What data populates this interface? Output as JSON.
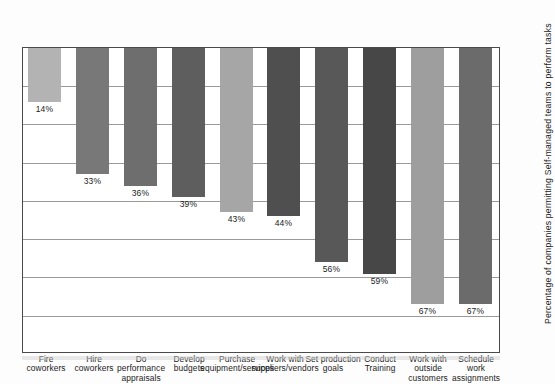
{
  "chart_data": {
    "type": "bar",
    "title": "",
    "xlabel": "",
    "ylabel": "Percentage of companies permitting Self-managed teams to perform tasks",
    "ylim": [
      0,
      80
    ],
    "grid": true,
    "legend": "none",
    "orientation": "vertical",
    "page_rotation_degrees": 180,
    "categories": [
      "Schedule work assignments",
      "Work with outside customers",
      "Conduct Training",
      "Set production goals",
      "Work with suppliers/vendors",
      "Purchase equipment/services",
      "Develop budgets",
      "Do performance appraisals",
      "Hire coworkers",
      "Fire coworkers"
    ],
    "values": [
      67,
      67,
      59,
      56,
      44,
      43,
      39,
      36,
      33,
      14
    ],
    "value_labels": [
      "67%",
      "67%",
      "59%",
      "56%",
      "44%",
      "43%",
      "39%",
      "36%",
      "33%",
      "14%"
    ],
    "bar_colors": [
      "#6b6b6b",
      "#9e9e9e",
      "#474747",
      "#585858",
      "#4f4f4f",
      "#a6a6a6",
      "#5e5e5e",
      "#6e6e6e",
      "#787878",
      "#b3b3b3"
    ],
    "gridline_values": [
      10,
      20,
      30,
      40,
      50,
      60,
      70
    ]
  },
  "axis": {
    "title": "Percentage of companies permitting Self-managed teams to perform tasks"
  }
}
